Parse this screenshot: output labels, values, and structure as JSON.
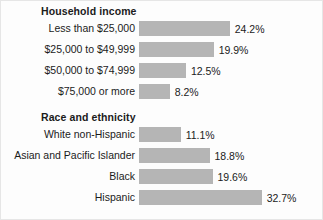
{
  "chart_data": {
    "type": "bar",
    "title": "",
    "orientation": "horizontal",
    "xlabel": "",
    "ylabel": "",
    "xlim": [
      0,
      35
    ],
    "grid": false,
    "legend": false,
    "value_suffix": "%",
    "bar_color": "#b5b5b5",
    "text_color": "#1b1b1b",
    "groups": [
      {
        "title": "Household income",
        "categories": [
          "Less than $25,000",
          "$25,000 to $49,999",
          "$50,000 to $74,999",
          "$75,000 or more"
        ],
        "values": [
          24.2,
          19.9,
          12.5,
          8.2
        ],
        "labels": [
          "24.2%",
          "19.9%",
          "12.5%",
          "8.2%"
        ]
      },
      {
        "title": "Race and ethnicity",
        "categories": [
          "White non-Hispanic",
          "Asian and Pacific Islander",
          "Black",
          "Hispanic"
        ],
        "values": [
          11.1,
          18.8,
          19.6,
          32.7
        ],
        "labels": [
          "11.1%",
          "18.8%",
          "19.6%",
          "32.7%"
        ]
      }
    ]
  }
}
